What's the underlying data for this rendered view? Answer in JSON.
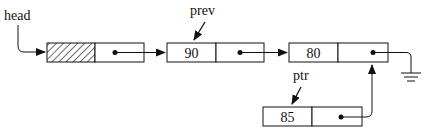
{
  "diagram": {
    "type": "linked-list-insertion",
    "labels": {
      "head": "head",
      "prev": "prev",
      "ptr": "ptr"
    },
    "nodes": [
      {
        "id": "head-node",
        "value": "",
        "hatched": true
      },
      {
        "id": "prev-node",
        "value": "90"
      },
      {
        "id": "node-80",
        "value": "80"
      },
      {
        "id": "ptr-node",
        "value": "85"
      }
    ],
    "terminator": "ground-null"
  }
}
